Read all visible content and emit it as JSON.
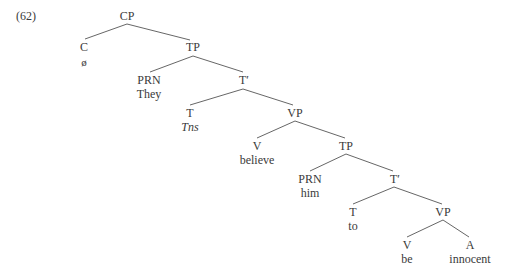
{
  "example_number": "(62)",
  "nodes": {
    "cp": {
      "label": "CP"
    },
    "c": {
      "label": "C",
      "word": "ø"
    },
    "tp1": {
      "label": "TP"
    },
    "prn1": {
      "label": "PRN",
      "word": "They"
    },
    "tbar1": {
      "label": "T′"
    },
    "t1": {
      "label": "T",
      "word": "Tns"
    },
    "vp1": {
      "label": "VP"
    },
    "v1": {
      "label": "V",
      "word": "believe"
    },
    "tp2": {
      "label": "TP"
    },
    "prn2": {
      "label": "PRN",
      "word": "him"
    },
    "tbar2": {
      "label": "T′"
    },
    "t2": {
      "label": "T",
      "word": "to"
    },
    "vp2": {
      "label": "VP"
    },
    "v2": {
      "label": "V",
      "word": "be"
    },
    "a": {
      "label": "A",
      "word": "innocent"
    }
  },
  "colors": {
    "line": "#555555",
    "text": "#3a3a3a"
  }
}
